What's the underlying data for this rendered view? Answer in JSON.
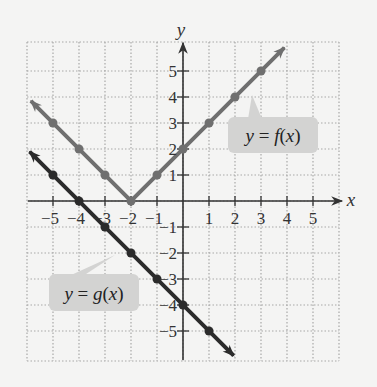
{
  "chart_data": {
    "type": "line",
    "title": "",
    "xlabel": "x",
    "ylabel": "y",
    "xlim": [
      -6,
      6
    ],
    "ylim": [
      -6,
      6
    ],
    "grid": true,
    "x_ticks": [
      -5,
      -4,
      -3,
      -2,
      -1,
      1,
      2,
      3,
      4,
      5
    ],
    "y_ticks": [
      5,
      4,
      3,
      2,
      1,
      -1,
      -2,
      -3,
      -4,
      -5
    ],
    "x_tick_labels": [
      "−5",
      "−4",
      "−3",
      "−2",
      "−1",
      "1",
      "2",
      "3",
      "4",
      "5"
    ],
    "y_tick_labels": [
      "5",
      "4",
      "3",
      "2",
      "1",
      "−1",
      "−2",
      "−3",
      "−4",
      "−5"
    ],
    "series": [
      {
        "name": "y = f(x)",
        "formula": "|x + 2|",
        "color": "#6f6f6f",
        "points": [
          [
            -5,
            3
          ],
          [
            -4,
            2
          ],
          [
            -3,
            1
          ],
          [
            -2,
            0
          ],
          [
            -1,
            1
          ],
          [
            0,
            2
          ],
          [
            1,
            3
          ],
          [
            2,
            4
          ],
          [
            3,
            5
          ]
        ],
        "line_start": [
          -5.85,
          3.85
        ],
        "vertex": [
          -2,
          0
        ],
        "line_end": [
          3.9,
          5.9
        ],
        "label": {
          "text": "y = f(x)",
          "box": [
            228,
            117,
            90,
            36
          ],
          "pointer": [
            252,
            95
          ]
        }
      },
      {
        "name": "y = g(x)",
        "formula": "-x - 4",
        "color": "#2b2b2b",
        "points": [
          [
            -5,
            1
          ],
          [
            -4,
            0
          ],
          [
            -3,
            -1
          ],
          [
            -2,
            -2
          ],
          [
            -1,
            -3
          ],
          [
            0,
            -4
          ],
          [
            1,
            -5
          ]
        ],
        "line_start": [
          -5.9,
          1.9
        ],
        "line_end": [
          1.95,
          -5.95
        ],
        "label": {
          "text": "y = g(x)",
          "box": [
            49,
            274,
            90,
            37
          ],
          "pointer": [
            115,
            255
          ]
        }
      }
    ]
  },
  "colors": {
    "background": "#f4f4f3",
    "grid": "#a8a8a8",
    "axis": "#333333",
    "label_box": "#d3d3d2"
  }
}
